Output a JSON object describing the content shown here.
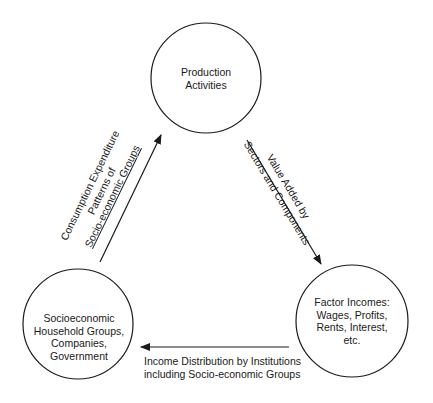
{
  "nodes": {
    "production": {
      "lines": [
        "Production",
        "Activities"
      ]
    },
    "factor": {
      "lines": [
        "Factor Incomes:",
        "Wages, Profits,",
        "Rents, Interest,",
        "etc."
      ]
    },
    "household": {
      "lines": [
        "Socioeconomic",
        "Household Groups,",
        "Companies,",
        "Government"
      ]
    }
  },
  "edges": {
    "value_added": {
      "lines": [
        "Value Added by",
        "Sectors and Components"
      ]
    },
    "income_distribution": {
      "lines": [
        "Income Distribution by Institutions",
        "including Socio-economic Groups"
      ]
    },
    "consumption": {
      "lines": [
        "Consumption Expenditure",
        "Patterns of",
        "Socio-economic Groups"
      ]
    }
  },
  "colors": {
    "stroke": "#1a1a1a",
    "background": "#ffffff"
  }
}
